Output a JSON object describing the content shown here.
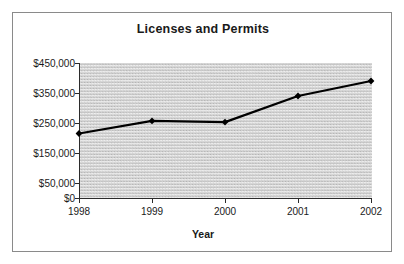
{
  "chart_data": {
    "type": "line",
    "title": "Licenses and Permits",
    "xlabel": "Year",
    "ylabel": "",
    "categories": [
      "1998",
      "1999",
      "2000",
      "2001",
      "2002"
    ],
    "x": [
      1998,
      1999,
      2000,
      2001,
      2002
    ],
    "values": [
      215000,
      257000,
      253000,
      340000,
      390000
    ],
    "series": [
      {
        "name": "Licenses and Permits",
        "values": [
          215000,
          257000,
          253000,
          340000,
          390000
        ]
      }
    ],
    "ylim": [
      0,
      450000
    ],
    "xlim": [
      1998,
      2002
    ],
    "ytick_labels": [
      "$0",
      "$50,000",
      "$150,000",
      "$250,000",
      "$350,000",
      "$450,000"
    ],
    "ytick_values": [
      0,
      50000,
      150000,
      250000,
      350000,
      450000
    ],
    "xtick_labels": [
      "1998",
      "1999",
      "2000",
      "2001",
      "2002"
    ],
    "grid": false,
    "legend": "none",
    "marker": "diamond",
    "line_color": "#000000",
    "plot_background": "#e2e2e2",
    "frame_color": "#8a8a8a"
  }
}
